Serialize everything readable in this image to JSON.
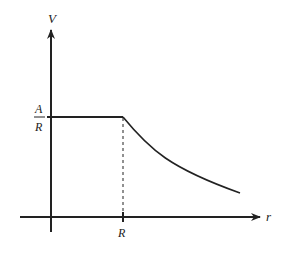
{
  "diagram": {
    "title": "",
    "axes": {
      "y_label": "V",
      "x_label": "r"
    },
    "labels": {
      "plateau_numerator": "A",
      "plateau_denominator": "R",
      "x_tick": "R"
    },
    "colors": {
      "line": "#222222",
      "background": "#ffffff"
    }
  }
}
